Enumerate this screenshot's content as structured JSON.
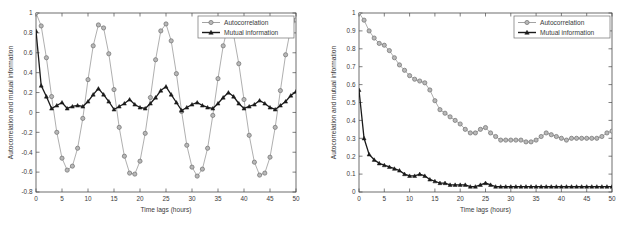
{
  "figure": {
    "background": "#ffffff",
    "panel_count": 2
  },
  "colors": {
    "autocorrelation": "#8c8c8c",
    "mutual_information": "#1a1a1a",
    "axis": "#4a4a4a",
    "text": "#3a3a3a",
    "legend_border": "#6f6f6f"
  },
  "chart_data": [
    {
      "id": "left-panel",
      "type": "line",
      "title": "",
      "xlabel": "Time lags (hours)",
      "ylabel": "Autocorrelation and mutual information",
      "xlim": [
        0,
        50
      ],
      "ylim": [
        -0.8,
        1
      ],
      "xticks": [
        0,
        5,
        10,
        15,
        20,
        25,
        30,
        35,
        40,
        45,
        50
      ],
      "xtick_labels": [
        "0",
        "5",
        "10",
        "15",
        "20",
        "25",
        "30",
        "35",
        "40",
        "45",
        "50"
      ],
      "yticks": [
        -0.8,
        -0.6,
        -0.4,
        -0.2,
        0,
        0.2,
        0.4,
        0.6,
        0.8,
        1
      ],
      "ytick_labels": [
        "-0.8",
        "-0.6",
        "-0.4",
        "-0.2",
        "0",
        "0.2",
        "0.4",
        "0.6",
        "0.8",
        "1"
      ],
      "grid": false,
      "legend_position": "upper right",
      "x": [
        0,
        1,
        2,
        3,
        4,
        5,
        6,
        7,
        8,
        9,
        10,
        11,
        12,
        13,
        14,
        15,
        16,
        17,
        18,
        19,
        20,
        21,
        22,
        23,
        24,
        25,
        26,
        27,
        28,
        29,
        30,
        31,
        32,
        33,
        34,
        35,
        36,
        37,
        38,
        39,
        40,
        41,
        42,
        43,
        44,
        45,
        46,
        47,
        48,
        49,
        50
      ],
      "series": [
        {
          "name": "Autocorrelation",
          "marker": "circle",
          "color": "#8c8c8c",
          "values": [
            1.0,
            0.87,
            0.55,
            0.16,
            -0.2,
            -0.46,
            -0.58,
            -0.54,
            -0.36,
            -0.06,
            0.33,
            0.67,
            0.88,
            0.85,
            0.59,
            0.23,
            -0.15,
            -0.44,
            -0.61,
            -0.62,
            -0.49,
            -0.21,
            0.15,
            0.53,
            0.82,
            0.89,
            0.72,
            0.39,
            0.01,
            -0.33,
            -0.55,
            -0.64,
            -0.57,
            -0.36,
            -0.03,
            0.34,
            0.67,
            0.89,
            0.78,
            0.49,
            0.13,
            -0.23,
            -0.5,
            -0.63,
            -0.61,
            -0.45,
            -0.15,
            0.22,
            0.58,
            0.85,
            0.93
          ]
        },
        {
          "name": "Mutual information",
          "marker": "triangle",
          "color": "#1a1a1a",
          "values": [
            0.82,
            0.27,
            0.16,
            0.04,
            0.07,
            0.1,
            0.04,
            0.06,
            0.07,
            0.06,
            0.11,
            0.18,
            0.24,
            0.18,
            0.11,
            0.03,
            0.06,
            0.09,
            0.13,
            0.08,
            0.05,
            0.04,
            0.09,
            0.15,
            0.22,
            0.26,
            0.18,
            0.1,
            0.02,
            0.05,
            0.08,
            0.1,
            0.07,
            0.05,
            0.04,
            0.09,
            0.15,
            0.2,
            0.16,
            0.09,
            0.04,
            0.06,
            0.08,
            0.12,
            0.09,
            0.05,
            0.03,
            0.07,
            0.11,
            0.17,
            0.21
          ]
        }
      ]
    },
    {
      "id": "right-panel",
      "type": "line",
      "title": "",
      "xlabel": "Time lags (hours)",
      "ylabel": "Autocorrelation and mutual information",
      "xlim": [
        0,
        50
      ],
      "ylim": [
        0,
        1
      ],
      "xticks": [
        0,
        5,
        10,
        15,
        20,
        25,
        30,
        35,
        40,
        45,
        50
      ],
      "xtick_labels": [
        "0",
        "5",
        "10",
        "15",
        "20",
        "25",
        "30",
        "35",
        "40",
        "45",
        "50"
      ],
      "yticks": [
        0,
        0.1,
        0.2,
        0.3,
        0.4,
        0.5,
        0.6,
        0.7,
        0.8,
        0.9,
        1
      ],
      "ytick_labels": [
        "0",
        "0.1",
        "0.2",
        "0.3",
        "0.4",
        "0.5",
        "0.6",
        "0.7",
        "0.8",
        "0.9",
        "1"
      ],
      "grid": false,
      "legend_position": "upper right",
      "x": [
        0,
        1,
        2,
        3,
        4,
        5,
        6,
        7,
        8,
        9,
        10,
        11,
        12,
        13,
        14,
        15,
        16,
        17,
        18,
        19,
        20,
        21,
        22,
        23,
        24,
        25,
        26,
        27,
        28,
        29,
        30,
        31,
        32,
        33,
        34,
        35,
        36,
        37,
        38,
        39,
        40,
        41,
        42,
        43,
        44,
        45,
        46,
        47,
        48,
        49,
        50
      ],
      "series": [
        {
          "name": "Autocorrelation",
          "marker": "circle",
          "color": "#8c8c8c",
          "values": [
            1.0,
            0.96,
            0.9,
            0.86,
            0.83,
            0.82,
            0.79,
            0.75,
            0.71,
            0.68,
            0.65,
            0.63,
            0.62,
            0.61,
            0.57,
            0.51,
            0.46,
            0.44,
            0.42,
            0.4,
            0.38,
            0.35,
            0.33,
            0.33,
            0.35,
            0.36,
            0.33,
            0.31,
            0.29,
            0.29,
            0.29,
            0.29,
            0.29,
            0.28,
            0.28,
            0.29,
            0.31,
            0.33,
            0.32,
            0.31,
            0.3,
            0.29,
            0.3,
            0.3,
            0.3,
            0.3,
            0.3,
            0.3,
            0.31,
            0.33,
            0.34
          ]
        },
        {
          "name": "Mutual information",
          "marker": "triangle",
          "color": "#1a1a1a",
          "values": [
            0.57,
            0.3,
            0.21,
            0.18,
            0.16,
            0.15,
            0.14,
            0.13,
            0.12,
            0.1,
            0.09,
            0.09,
            0.1,
            0.09,
            0.07,
            0.06,
            0.05,
            0.05,
            0.04,
            0.04,
            0.04,
            0.04,
            0.03,
            0.03,
            0.04,
            0.05,
            0.04,
            0.03,
            0.03,
            0.03,
            0.03,
            0.03,
            0.03,
            0.03,
            0.03,
            0.03,
            0.03,
            0.03,
            0.03,
            0.03,
            0.03,
            0.03,
            0.03,
            0.03,
            0.03,
            0.03,
            0.03,
            0.03,
            0.03,
            0.03,
            0.03
          ]
        }
      ]
    }
  ],
  "legend": {
    "items": [
      {
        "label": "Autocorrelation",
        "marker": "circle",
        "color": "#8c8c8c"
      },
      {
        "label": "Mutual information",
        "marker": "triangle",
        "color": "#1a1a1a"
      }
    ]
  }
}
